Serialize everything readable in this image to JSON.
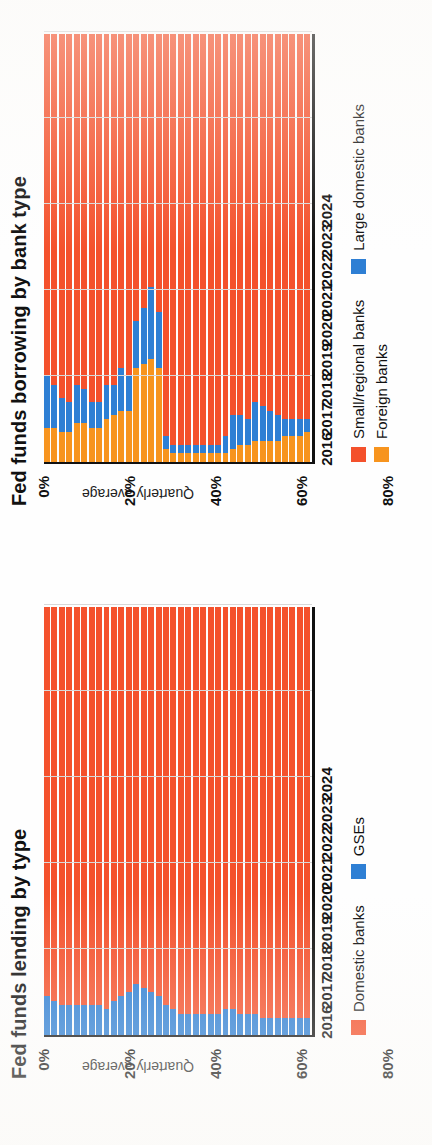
{
  "colors": {
    "small_regional_banks": "#F4512C",
    "large_domestic_banks": "#2E7FD4",
    "foreign_banks": "#F7941E",
    "domestic_banks": "#F4512C",
    "gses": "#2E7FD4",
    "axis": "#111111",
    "gridline": "#D8D8D8",
    "background": "#FEFEFE"
  },
  "panels": {
    "borrowing": {
      "title": "Fed funds borrowing by bank type",
      "yaxis_title": "Quarterly average",
      "ytick_labels": [
        "100%",
        "80%",
        "60%",
        "40%",
        "20%",
        "0%"
      ],
      "xtick_labels": [
        "2016",
        "2017",
        "2018",
        "2019",
        "2020",
        "2021",
        "2022",
        "2023",
        "2024"
      ],
      "legend": [
        {
          "label": "Small/regional banks",
          "color": "#F4512C"
        },
        {
          "label": "Large domestic banks",
          "color": "#2E7FD4"
        },
        {
          "label": "Foreign banks",
          "color": "#F7941E"
        }
      ]
    },
    "lending": {
      "title": "Fed funds lending by type",
      "yaxis_title": "Quarterly average",
      "ytick_labels": [
        "100%",
        "80%",
        "60%",
        "40%",
        "20%",
        "0%"
      ],
      "xtick_labels": [
        "2016",
        "2017",
        "2018",
        "2019",
        "2020",
        "2021",
        "2022",
        "2023",
        "2024"
      ],
      "legend": [
        {
          "label": "Domestic banks",
          "color": "#F4512C"
        },
        {
          "label": "GSEs",
          "color": "#2E7FD4"
        }
      ]
    }
  },
  "chart_data": [
    {
      "type": "bar",
      "id": "fed-funds-borrowing-by-bank-type",
      "title": "Fed funds borrowing by bank type",
      "subtitle": "",
      "xlabel": "",
      "ylabel": "Quarterly average",
      "ylim": [
        0,
        100
      ],
      "yticks": [
        0,
        20,
        40,
        60,
        80,
        100
      ],
      "ytick_labels": [
        "0%",
        "20%",
        "40%",
        "60%",
        "80%",
        "100%"
      ],
      "stacked": true,
      "normalized_percent": true,
      "orientation": "vertical",
      "grid": "y-gridlines-only",
      "legend_position": "bottom",
      "x": [
        "2016Q1",
        "2016Q2",
        "2016Q3",
        "2016Q4",
        "2017Q1",
        "2017Q2",
        "2017Q3",
        "2017Q4",
        "2018Q1",
        "2018Q2",
        "2018Q3",
        "2018Q4",
        "2019Q1",
        "2019Q2",
        "2019Q3",
        "2019Q4",
        "2020Q1",
        "2020Q2",
        "2020Q3",
        "2020Q4",
        "2021Q1",
        "2021Q2",
        "2021Q3",
        "2021Q4",
        "2022Q1",
        "2022Q2",
        "2022Q3",
        "2022Q4",
        "2023Q1",
        "2023Q2",
        "2023Q3",
        "2023Q4",
        "2024Q1",
        "2024Q2",
        "2024Q3",
        "2024Q4"
      ],
      "categories": [
        "2016",
        "2017",
        "2018",
        "2019",
        "2020",
        "2021",
        "2022",
        "2023",
        "2024"
      ],
      "series": [
        {
          "name": "Foreign banks",
          "color": "#F7941E",
          "values": [
            8,
            8,
            7,
            7,
            9,
            9,
            8,
            8,
            10,
            11,
            12,
            12,
            22,
            23,
            24,
            22,
            3,
            2,
            2,
            2,
            2,
            2,
            2,
            2,
            2,
            3,
            4,
            4,
            5,
            5,
            5,
            5,
            6,
            6,
            6,
            7
          ]
        },
        {
          "name": "Large domestic banks",
          "color": "#2E7FD4",
          "values": [
            12,
            10,
            8,
            7,
            9,
            8,
            6,
            6,
            8,
            7,
            10,
            8,
            11,
            13,
            17,
            13,
            3,
            2,
            2,
            2,
            2,
            2,
            2,
            2,
            4,
            8,
            7,
            6,
            9,
            8,
            7,
            6,
            4,
            4,
            4,
            3
          ]
        },
        {
          "name": "Small/regional banks",
          "color": "#F4512C",
          "values": [
            80,
            82,
            85,
            86,
            82,
            83,
            86,
            86,
            82,
            82,
            78,
            80,
            67,
            64,
            59,
            65,
            94,
            96,
            96,
            96,
            96,
            96,
            96,
            96,
            94,
            89,
            89,
            90,
            86,
            87,
            88,
            89,
            90,
            90,
            90,
            90
          ]
        }
      ]
    },
    {
      "type": "bar",
      "id": "fed-funds-lending-by-type",
      "title": "Fed funds lending by type",
      "subtitle": "",
      "xlabel": "",
      "ylabel": "Quarterly average",
      "ylim": [
        0,
        100
      ],
      "yticks": [
        0,
        20,
        40,
        60,
        80,
        100
      ],
      "ytick_labels": [
        "0%",
        "20%",
        "40%",
        "60%",
        "80%",
        "100%"
      ],
      "stacked": true,
      "normalized_percent": true,
      "orientation": "vertical",
      "grid": "y-gridlines-only",
      "legend_position": "bottom",
      "x": [
        "2016Q1",
        "2016Q2",
        "2016Q3",
        "2016Q4",
        "2017Q1",
        "2017Q2",
        "2017Q3",
        "2017Q4",
        "2018Q1",
        "2018Q2",
        "2018Q3",
        "2018Q4",
        "2019Q1",
        "2019Q2",
        "2019Q3",
        "2019Q4",
        "2020Q1",
        "2020Q2",
        "2020Q3",
        "2020Q4",
        "2021Q1",
        "2021Q2",
        "2021Q3",
        "2021Q4",
        "2022Q1",
        "2022Q2",
        "2022Q3",
        "2022Q4",
        "2023Q1",
        "2023Q2",
        "2023Q3",
        "2023Q4",
        "2024Q1",
        "2024Q2",
        "2024Q3",
        "2024Q4"
      ],
      "categories": [
        "2016",
        "2017",
        "2018",
        "2019",
        "2020",
        "2021",
        "2022",
        "2023",
        "2024"
      ],
      "series": [
        {
          "name": "GSEs",
          "color": "#2E7FD4",
          "values": [
            9,
            8,
            7,
            7,
            7,
            7,
            7,
            7,
            6,
            8,
            9,
            10,
            12,
            11,
            10,
            9,
            7,
            6,
            5,
            5,
            5,
            5,
            5,
            5,
            6,
            6,
            5,
            5,
            5,
            4,
            4,
            4,
            4,
            4,
            4,
            4
          ]
        },
        {
          "name": "Domestic banks",
          "color": "#F4512C",
          "values": [
            91,
            92,
            93,
            93,
            93,
            93,
            93,
            93,
            94,
            92,
            91,
            90,
            88,
            89,
            90,
            91,
            93,
            94,
            95,
            95,
            95,
            95,
            95,
            95,
            94,
            94,
            95,
            95,
            95,
            96,
            96,
            96,
            96,
            96,
            96,
            96
          ]
        }
      ]
    }
  ]
}
